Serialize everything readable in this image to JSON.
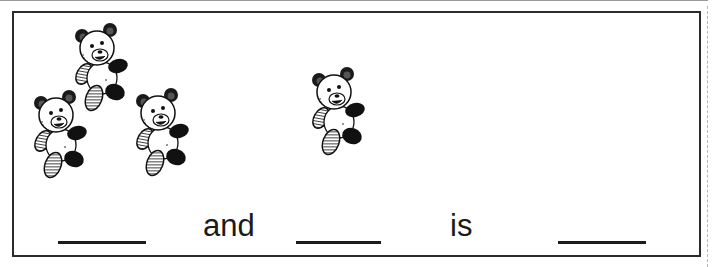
{
  "worksheet": {
    "title": "Addition with bears",
    "groups": [
      {
        "name": "group-left",
        "count": 3,
        "item": "teddy-bear"
      },
      {
        "name": "group-right",
        "count": 1,
        "item": "teddy-bear"
      }
    ],
    "sentence": {
      "word_and": "and",
      "word_is": "is",
      "blanks": [
        "",
        "",
        ""
      ]
    }
  }
}
